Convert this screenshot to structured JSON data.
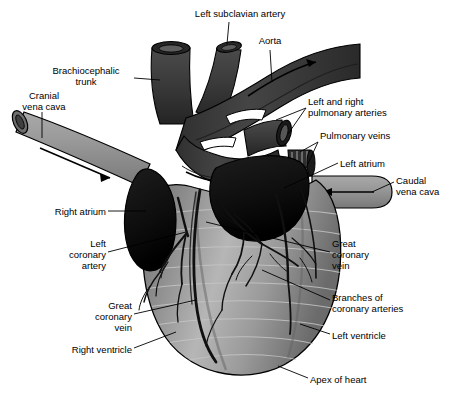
{
  "figure": {
    "subject": "heart",
    "view": "ventral",
    "background_color": "#ffffff",
    "text_color": "#000000",
    "leader_line_color": "#000000"
  },
  "palette": {
    "vessel_dark": "#3a3a3a",
    "vessel_darker": "#2b2b2b",
    "atrium_black": "#101010",
    "vena_cava_gray": "#8e8e8e",
    "vena_cava_gray_light": "#a6a6a6",
    "ventricle_gray": "#8f8f8f",
    "ventricle_highlight": "#b9b9b9",
    "ventricle_shadow": "#6e6e6e",
    "coronary_vessel": "#141414",
    "outline": "#000000",
    "striation": "#c8c8c8"
  },
  "labels": [
    {
      "id": "left-subclavian-artery",
      "text": "Left subclavian artery",
      "align": "center",
      "x": 180,
      "y": 8,
      "width": 120
    },
    {
      "id": "aorta",
      "text": "Aorta",
      "align": "center",
      "x": 245,
      "y": 35,
      "width": 50
    },
    {
      "id": "brachiocephalic-trunk",
      "text": "Brachiocephalic\ntrunk",
      "align": "center",
      "x": 40,
      "y": 65,
      "width": 92
    },
    {
      "id": "cranial-vena-cava",
      "text": "Cranial\nvena cava",
      "align": "center",
      "x": 10,
      "y": 90,
      "width": 68
    },
    {
      "id": "left-and-right-pulmonary-arteries",
      "text": "Left and right\npulmonary arteries",
      "align": "left",
      "x": 308,
      "y": 96,
      "width": 120
    },
    {
      "id": "pulmonary-veins",
      "text": "Pulmonary veins",
      "align": "left",
      "x": 320,
      "y": 130,
      "width": 110
    },
    {
      "id": "left-atrium",
      "text": "Left atrium",
      "align": "left",
      "x": 340,
      "y": 158,
      "width": 80
    },
    {
      "id": "caudal-vena-cava",
      "text": "Caudal\nvena cava",
      "align": "left",
      "x": 396,
      "y": 175,
      "width": 64
    },
    {
      "id": "right-atrium",
      "text": "Right atrium",
      "align": "right",
      "x": 24,
      "y": 206,
      "width": 82
    },
    {
      "id": "left-coronary-artery",
      "text": "Left\ncoronary\nartery",
      "align": "right",
      "x": 36,
      "y": 238,
      "width": 70
    },
    {
      "id": "great-coronary-vein-right",
      "text": "Great\ncoronary\nvein",
      "align": "left",
      "x": 332,
      "y": 238,
      "width": 70
    },
    {
      "id": "branches-of-coronary-arteries",
      "text": "Branches of\ncoronary arteries",
      "align": "left",
      "x": 332,
      "y": 292,
      "width": 108
    },
    {
      "id": "great-coronary-vein-left",
      "text": "Great\ncoronary\nvein",
      "align": "right",
      "x": 62,
      "y": 300,
      "width": 70
    },
    {
      "id": "left-ventricle",
      "text": "Left ventricle",
      "align": "left",
      "x": 332,
      "y": 330,
      "width": 88
    },
    {
      "id": "right-ventricle",
      "text": "Right ventricle",
      "align": "right",
      "x": 40,
      "y": 344,
      "width": 92
    },
    {
      "id": "apex-of-heart",
      "text": "Apex of heart",
      "align": "left",
      "x": 310,
      "y": 374,
      "width": 92
    }
  ],
  "structures": [
    {
      "id": "aorta",
      "name": "Aorta",
      "tone": "dark",
      "blood_flow_arrow": true
    },
    {
      "id": "left-subclavian-artery",
      "name": "Left subclavian artery",
      "tone": "dark",
      "blood_flow_arrow": false
    },
    {
      "id": "brachiocephalic-trunk",
      "name": "Brachiocephalic trunk",
      "tone": "dark",
      "blood_flow_arrow": false
    },
    {
      "id": "cranial-vena-cava",
      "name": "Cranial vena cava",
      "tone": "mid-gray",
      "blood_flow_arrow": true
    },
    {
      "id": "caudal-vena-cava",
      "name": "Caudal vena cava",
      "tone": "mid-gray",
      "blood_flow_arrow": true
    },
    {
      "id": "pulmonary-arteries",
      "name": "Left and right pulmonary arteries",
      "tone": "dark",
      "blood_flow_arrow": false
    },
    {
      "id": "pulmonary-veins",
      "name": "Pulmonary veins",
      "tone": "dark",
      "blood_flow_arrow": false
    },
    {
      "id": "left-atrium",
      "name": "Left atrium",
      "tone": "black",
      "blood_flow_arrow": false
    },
    {
      "id": "right-atrium",
      "name": "Right atrium",
      "tone": "black",
      "blood_flow_arrow": false
    },
    {
      "id": "left-ventricle",
      "name": "Left ventricle",
      "tone": "gray",
      "blood_flow_arrow": false
    },
    {
      "id": "right-ventricle",
      "name": "Right ventricle",
      "tone": "gray",
      "blood_flow_arrow": false
    },
    {
      "id": "great-coronary-vein",
      "name": "Great coronary vein",
      "tone": "black-vessel",
      "blood_flow_arrow": false
    },
    {
      "id": "left-coronary-artery",
      "name": "Left coronary artery",
      "tone": "black-vessel",
      "blood_flow_arrow": false
    },
    {
      "id": "coronary-artery-branches",
      "name": "Branches of coronary arteries",
      "tone": "black-vessel",
      "blood_flow_arrow": false
    },
    {
      "id": "apex-of-heart",
      "name": "Apex of heart",
      "tone": "gray",
      "blood_flow_arrow": false
    }
  ]
}
